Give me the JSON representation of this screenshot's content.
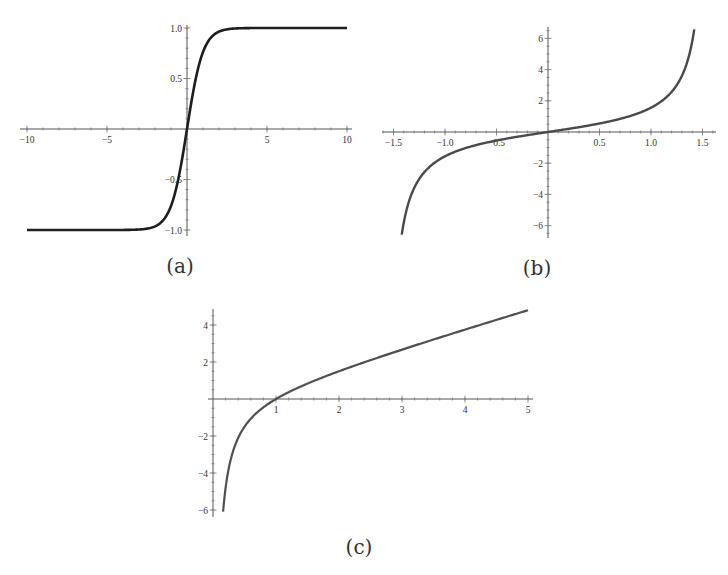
{
  "figure": {
    "captions": [
      "(a)",
      "(b)",
      "(c)"
    ]
  },
  "chart_data": [
    {
      "id": "a",
      "type": "line",
      "title": "",
      "caption": "(a)",
      "function": "tanh(x)",
      "xlabel": "",
      "ylabel": "",
      "xlim": [
        -10,
        10
      ],
      "ylim": [
        -1.0,
        1.0
      ],
      "grid": false,
      "x_ticks": [
        -10,
        -5,
        5,
        10
      ],
      "x_tick_labels": [
        "-10",
        "-5",
        "5",
        "10"
      ],
      "y_ticks": [
        1.0,
        0.5,
        -0.5,
        -1.0
      ],
      "y_tick_labels": [
        "1.0",
        "0.5",
        "-0.5",
        "-1.0"
      ],
      "x": [
        -10,
        -5,
        -3,
        -2,
        -1.5,
        -1,
        -0.5,
        0,
        0.5,
        1,
        1.5,
        2,
        3,
        5,
        10
      ],
      "y": [
        -1.0,
        -1.0,
        -0.995,
        -0.964,
        -0.905,
        -0.762,
        -0.462,
        0,
        0.462,
        0.762,
        0.905,
        0.964,
        0.995,
        1.0,
        1.0
      ],
      "color": "#1e1e1e"
    },
    {
      "id": "b",
      "type": "line",
      "title": "",
      "caption": "(b)",
      "function": "tan(x)",
      "xlabel": "",
      "ylabel": "",
      "xlim": [
        -1.42,
        1.42
      ],
      "ylim": [
        -6.5,
        6.5
      ],
      "grid": false,
      "x_ticks": [
        -1.5,
        -1.0,
        -0.5,
        0.5,
        1.0,
        1.5
      ],
      "x_tick_labels": [
        "-1.5",
        "-1.0",
        "-0.5",
        "0.5",
        "1.0",
        "1.5"
      ],
      "y_ticks": [
        6,
        4,
        2,
        -2,
        -4,
        -6
      ],
      "y_tick_labels": [
        "6",
        "4",
        "2",
        "-2",
        "-4",
        "-6"
      ],
      "x": [
        -1.42,
        -1.3,
        -1.2,
        -1.0,
        -0.5,
        0,
        0.5,
        1.0,
        1.2,
        1.3,
        1.42
      ],
      "y": [
        -6.58,
        -3.6,
        -2.57,
        -1.56,
        -0.55,
        0,
        0.55,
        1.56,
        2.57,
        3.6,
        6.58
      ],
      "color": "#4a4a4a"
    },
    {
      "id": "c",
      "type": "line",
      "title": "",
      "caption": "(c)",
      "function": "x - 1/x",
      "xlabel": "",
      "ylabel": "",
      "xlim": [
        0.16,
        5
      ],
      "ylim": [
        -6,
        4.8
      ],
      "grid": false,
      "x_ticks": [
        1,
        2,
        3,
        4,
        5
      ],
      "x_tick_labels": [
        "1",
        "2",
        "3",
        "4",
        "5"
      ],
      "y_ticks": [
        4,
        2,
        -2,
        -4,
        -6
      ],
      "y_tick_labels": [
        "4",
        "2",
        "-2",
        "-4",
        "-6"
      ],
      "x": [
        0.16,
        0.25,
        0.5,
        0.75,
        1,
        1.5,
        2,
        3,
        4,
        5
      ],
      "y": [
        -6.09,
        -3.75,
        -1.5,
        -0.58,
        0,
        0.83,
        1.5,
        2.67,
        3.75,
        4.8
      ],
      "color": "#505050"
    }
  ]
}
